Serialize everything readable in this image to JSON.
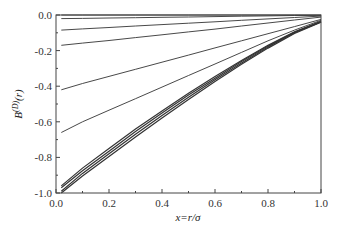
{
  "chart_data": {
    "type": "line",
    "title": "",
    "xlabel": "x=r/σ",
    "ylabel": "B^(D)(r)",
    "xlim": [
      0.0,
      1.0
    ],
    "ylim": [
      -1.0,
      0.0
    ],
    "xticks": [
      "0.0",
      "0.2",
      "0.4",
      "0.6",
      "0.8",
      "1.0"
    ],
    "yticks": [
      "0.0",
      "-0.2",
      "-0.4",
      "-0.6",
      "-0.8",
      "-1.0"
    ],
    "grid": false,
    "legend": null,
    "x": [
      0.02,
      0.1,
      0.2,
      0.3,
      0.4,
      0.5,
      0.6,
      0.7,
      0.8,
      0.9,
      1.0
    ],
    "series": [
      {
        "name": "curve-1",
        "values": [
          0.0,
          0.0,
          0.0,
          0.0,
          0.0,
          0.0,
          0.0,
          0.0,
          0.0,
          0.0,
          0.0
        ]
      },
      {
        "name": "curve-2",
        "values": [
          -0.02,
          -0.019,
          -0.017,
          -0.015,
          -0.013,
          -0.011,
          -0.009,
          -0.007,
          -0.005,
          -0.003,
          -0.002
        ]
      },
      {
        "name": "curve-3",
        "values": [
          -0.085,
          -0.078,
          -0.07,
          -0.062,
          -0.054,
          -0.046,
          -0.038,
          -0.03,
          -0.022,
          -0.014,
          -0.006
        ]
      },
      {
        "name": "curve-4",
        "values": [
          -0.17,
          -0.158,
          -0.143,
          -0.127,
          -0.111,
          -0.095,
          -0.079,
          -0.062,
          -0.045,
          -0.028,
          -0.012
        ]
      },
      {
        "name": "curve-5",
        "values": [
          -0.42,
          -0.385,
          -0.345,
          -0.305,
          -0.265,
          -0.225,
          -0.185,
          -0.145,
          -0.105,
          -0.065,
          -0.025
        ]
      },
      {
        "name": "curve-6",
        "values": [
          -0.66,
          -0.6,
          -0.535,
          -0.47,
          -0.405,
          -0.34,
          -0.275,
          -0.21,
          -0.145,
          -0.085,
          -0.03
        ]
      },
      {
        "name": "curve-7",
        "values": [
          -0.96,
          -0.86,
          -0.75,
          -0.64,
          -0.54,
          -0.44,
          -0.345,
          -0.255,
          -0.17,
          -0.095,
          -0.035
        ]
      },
      {
        "name": "curve-8",
        "values": [
          -0.97,
          -0.875,
          -0.765,
          -0.655,
          -0.55,
          -0.45,
          -0.355,
          -0.262,
          -0.175,
          -0.098,
          -0.037
        ]
      },
      {
        "name": "curve-9",
        "values": [
          -0.99,
          -0.89,
          -0.78,
          -0.67,
          -0.565,
          -0.462,
          -0.364,
          -0.27,
          -0.18,
          -0.1,
          -0.039
        ]
      },
      {
        "name": "curve-10",
        "values": [
          -1.0,
          -0.905,
          -0.795,
          -0.685,
          -0.578,
          -0.474,
          -0.373,
          -0.277,
          -0.186,
          -0.104,
          -0.041
        ]
      }
    ]
  }
}
